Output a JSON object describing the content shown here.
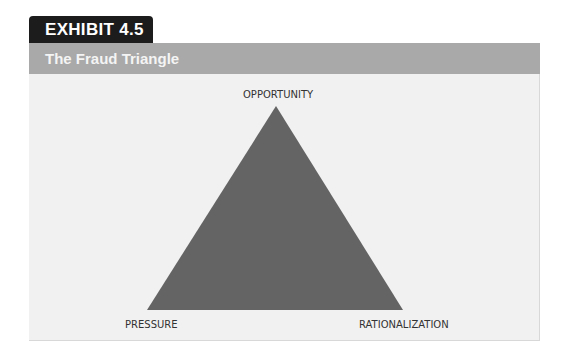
{
  "exhibit": {
    "label": "EXHIBIT 4.5"
  },
  "title": "The Fraud Triangle",
  "diagram": {
    "shape": "triangle",
    "fill_color": "#646464",
    "vertices": {
      "top": "OPPORTUNITY",
      "bottom_left": "PRESSURE",
      "bottom_right": "RATIONALIZATION"
    }
  }
}
